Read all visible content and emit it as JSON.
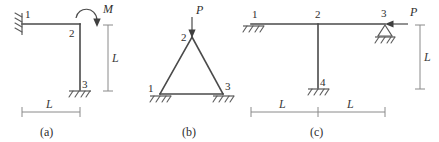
{
  "figure": {
    "width": 439,
    "height": 142,
    "stroke_color": "#4a4a4a",
    "support_color": "#5a5a5a",
    "dimension_color": "#8a8a8a",
    "background": "#ffffff"
  },
  "frames": [
    {
      "caption": "(a)",
      "type": "portal-frame",
      "nodes": [
        {
          "id": "1",
          "label": "1",
          "support": "fixed-wall"
        },
        {
          "id": "2",
          "label": "2",
          "support": "none"
        },
        {
          "id": "3",
          "label": "3",
          "support": "fixed-ground"
        }
      ],
      "loads": [
        {
          "symbol": "M",
          "type": "moment",
          "direction": "clockwise",
          "at_node": "2"
        }
      ],
      "dimensions": [
        {
          "label": "L",
          "orientation": "vertical"
        },
        {
          "label": "L",
          "orientation": "horizontal"
        }
      ]
    },
    {
      "caption": "(b)",
      "type": "triangular-truss",
      "nodes": [
        {
          "id": "1",
          "label": "1",
          "support": "hatched-ground"
        },
        {
          "id": "2",
          "label": "2",
          "support": "none"
        },
        {
          "id": "3",
          "label": "3",
          "support": "hatched-ground"
        }
      ],
      "loads": [
        {
          "symbol": "P",
          "type": "force",
          "direction": "down",
          "at_node": "2"
        }
      ],
      "dimensions": []
    },
    {
      "caption": "(c)",
      "type": "tee-frame",
      "nodes": [
        {
          "id": "1",
          "label": "1",
          "support": "hatched-ground"
        },
        {
          "id": "2",
          "label": "2",
          "support": "none"
        },
        {
          "id": "3",
          "label": "3",
          "support": "pin-triangle"
        },
        {
          "id": "4",
          "label": "4",
          "support": "hatched-ground"
        }
      ],
      "loads": [
        {
          "symbol": "P",
          "type": "force",
          "direction": "left",
          "at_node": "3"
        }
      ],
      "dimensions": [
        {
          "label": "L",
          "orientation": "horizontal"
        },
        {
          "label": "L",
          "orientation": "horizontal"
        },
        {
          "label": "L",
          "orientation": "vertical"
        }
      ]
    }
  ]
}
